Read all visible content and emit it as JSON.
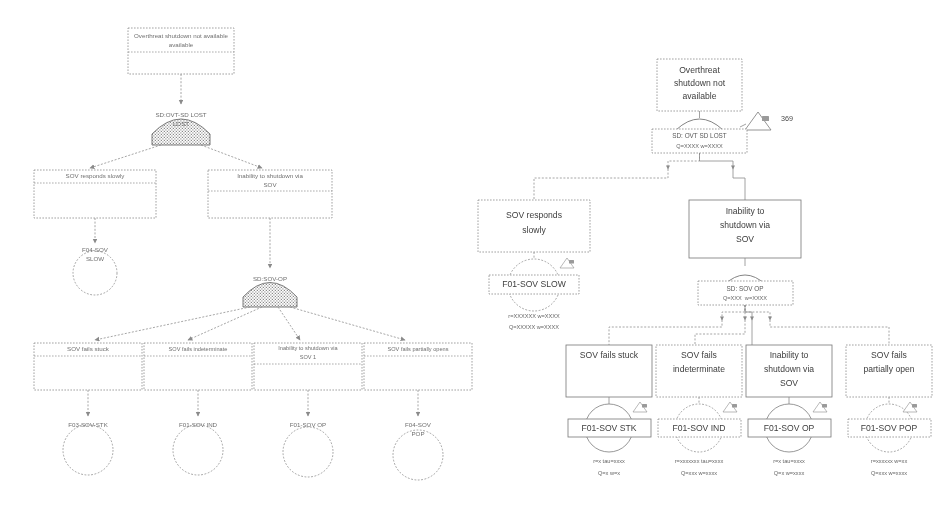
{
  "document": {
    "kind": "fault-tree-diagram-comparison",
    "panels": [
      "left-legacy-rendering",
      "right-modern-rendering"
    ]
  },
  "left_diagram": {
    "title_box": {
      "label": "Overthreat shutdown not available"
    },
    "top_gate": {
      "label": "SD:OVT-SD LOST",
      "type": "or-gate"
    },
    "mid_boxes": [
      {
        "label": "SOV responds slowly"
      },
      {
        "label": "Inability to shutdown via SOV"
      }
    ],
    "mid_event": {
      "label": "F01-SOV SLOW"
    },
    "mid_gate": {
      "label": "SD:SOV-OP",
      "type": "or-gate"
    },
    "bottom_boxes": [
      {
        "label": "SOV fails stuck"
      },
      {
        "label": "SOV fails indeterminate"
      },
      {
        "label": "Inability to shutdown via SOV 1"
      },
      {
        "label": "SOV fails partially opens"
      }
    ],
    "bottom_events": [
      {
        "label": "F03-SOV-STK"
      },
      {
        "label": "F01-SOV IND"
      },
      {
        "label": "F01-SOV OP"
      },
      {
        "label": "F01-SOV POP"
      }
    ]
  },
  "right_diagram": {
    "title_box": {
      "label_lines": [
        "Overthreat",
        "shutdown not",
        "available"
      ]
    },
    "top_transfer": {
      "label": "369"
    },
    "top_gate": {
      "type": "or-gate",
      "name": "SD: OVT SD LOST",
      "stats": "Q=XXXX w=XXXX"
    },
    "mid_boxes": [
      {
        "label_lines": [
          "SOV responds",
          "slowly"
        ]
      },
      {
        "label_lines": [
          "Inability to",
          "shutdown via",
          "SOV"
        ]
      }
    ],
    "mid_event": {
      "label": "F01-SOV SLOW",
      "stats_line1": "r=XXXXXX w=XXXX",
      "stats_line2": "Q=XXXXX w=XXXX",
      "transfer": "369"
    },
    "mid_gate": {
      "type": "or-gate",
      "name": "SD: SOV OP",
      "stats": "Q=XXX  w=XXXX"
    },
    "bottom_boxes": [
      {
        "label_lines": [
          "SOV fails stuck"
        ]
      },
      {
        "label_lines": [
          "SOV fails",
          "indeterminate"
        ]
      },
      {
        "label_lines": [
          "Inability to",
          "shutdown via",
          "SOV"
        ]
      },
      {
        "label_lines": [
          "SOV fails",
          "partially open"
        ]
      }
    ],
    "bottom_events": [
      {
        "label": "F01-SOV STK",
        "stats_line1": "r=x tau=xxxx",
        "stats_line2": "Q=x w=x",
        "transfer": "369"
      },
      {
        "label": "F01-SOV IND",
        "stats_line1": "r=xxxxxxx tau=xxxx",
        "stats_line2": "Q=xxx w=xxxx",
        "transfer": "369"
      },
      {
        "label": "F01-SOV OP",
        "stats_line1": "r=x tau=xxxx",
        "stats_line2": "Q=x w=xxxx",
        "transfer": "369"
      },
      {
        "label": "F01-SOV POP",
        "stats_line1": "r=xxxxxx w=xx",
        "stats_line2": "Q=xxx w=xxxx",
        "transfer": "369"
      }
    ]
  },
  "colors": {
    "background": "#ffffff",
    "stroke": "#8a8a8a",
    "text": "#4a4a4a",
    "gate_fill": "#c9c9c9"
  }
}
